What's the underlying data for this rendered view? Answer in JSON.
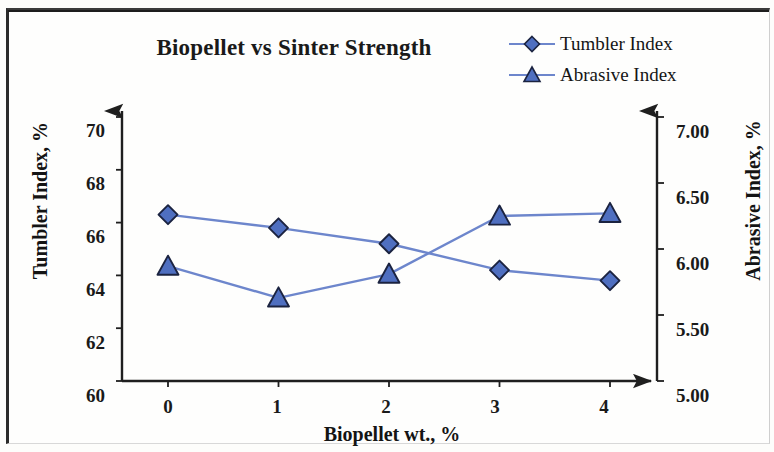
{
  "figure": {
    "title": "Biopellet vs Sinter Strength",
    "border_color": "#2b2b2b",
    "background": "#fdfdfb"
  },
  "legend": {
    "position": "top-right",
    "items": [
      {
        "label": "Tumbler Index",
        "marker": "diamond-marker-icon",
        "color": "#4f6fc0"
      },
      {
        "label": "Abrasive Index",
        "marker": "triangle-marker-icon",
        "color": "#4f6fc0"
      }
    ]
  },
  "axes": {
    "x": {
      "title": "Biopellet wt., %",
      "ticks": [
        "0",
        "1",
        "2",
        "3",
        "4"
      ]
    },
    "y_left": {
      "title": "Tumbler Index, %",
      "ticks": [
        "60",
        "62",
        "64",
        "66",
        "68",
        "70"
      ]
    },
    "y_right": {
      "title": "Abrasive Index, %",
      "ticks": [
        "5.00",
        "5.50",
        "6.00",
        "6.50",
        "7.00"
      ]
    }
  },
  "chart_data": {
    "type": "line",
    "title": "Biopellet vs Sinter Strength",
    "xlabel": "Biopellet wt., %",
    "ylabel": "Tumbler Index, %",
    "y2label": "Abrasive Index, %",
    "x": [
      0,
      1,
      2,
      3,
      4
    ],
    "xlim": [
      0,
      4
    ],
    "ylim": [
      60,
      70
    ],
    "y2lim": [
      5.0,
      7.0
    ],
    "grid": false,
    "legend_position": "top-right",
    "series": [
      {
        "name": "Tumbler Index",
        "axis": "left",
        "marker": "diamond",
        "color": "#4f6fc0",
        "values": [
          66.3,
          65.8,
          65.2,
          64.2,
          63.8
        ]
      },
      {
        "name": "Abrasive Index",
        "axis": "right",
        "marker": "triangle",
        "color": "#4f6fc0",
        "values": [
          5.87,
          5.63,
          5.81,
          6.25,
          6.27
        ]
      }
    ]
  }
}
